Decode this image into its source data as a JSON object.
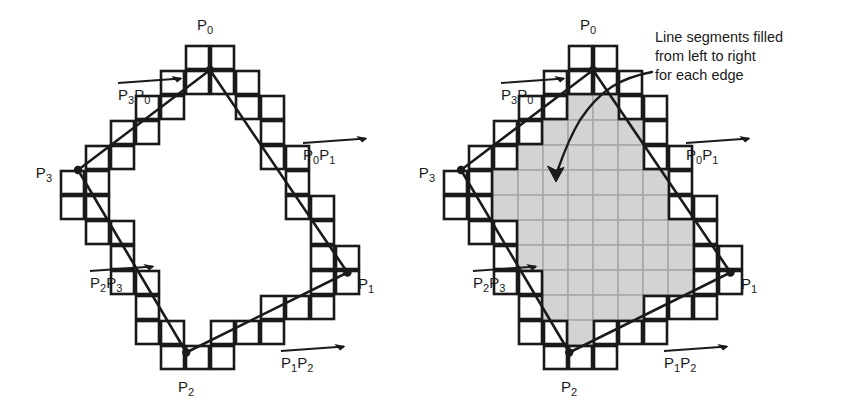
{
  "figure": {
    "background": "#ffffff",
    "ink": "#1a1a1a",
    "fill_gray": "#d3d3d3",
    "grid_gray": "#a8a8a8",
    "cell": 25,
    "panels": [
      {
        "id": "left",
        "name": "outline-only",
        "origin": [
          60,
          45
        ],
        "filled": false,
        "vertices": [
          {
            "key": "P0",
            "label": "P",
            "sub": "0",
            "grid": [
              6.0,
              1.0
            ],
            "label_pos": [
              205,
              30
            ],
            "anchor": "middle"
          },
          {
            "key": "P1",
            "label": "P",
            "sub": "1",
            "grid": [
              11.5,
              9.1
            ],
            "label_pos": [
              358,
              289
            ],
            "anchor": "start"
          },
          {
            "key": "P2",
            "label": "P",
            "sub": "2",
            "grid": [
              5.05,
              12.3
            ],
            "grid_dot": [
              5.05,
              12.3
            ],
            "label_pos": [
              186,
              392
            ],
            "anchor": "middle"
          },
          {
            "key": "P3",
            "label": "P",
            "sub": "3",
            "grid": [
              0.72,
              5.0
            ],
            "label_pos": [
              52,
              178
            ],
            "anchor": "end"
          }
        ],
        "edge_labels": [
          {
            "key": "P3P0",
            "a": "P",
            "asub": "3",
            "b": "P",
            "bsub": "0",
            "x": 118,
            "y": 100,
            "bar_w": 72
          },
          {
            "key": "P0P1",
            "a": "P",
            "asub": "0",
            "b": "P",
            "bsub": "1",
            "x": 303,
            "y": 160,
            "bar_w": 72
          },
          {
            "key": "P2P3",
            "a": "P",
            "asub": "2",
            "b": "P",
            "bsub": "3",
            "x": 90,
            "y": 288,
            "bar_w": 72
          },
          {
            "key": "P1P2",
            "a": "P",
            "asub": "1",
            "b": "P",
            "bsub": "2",
            "x": 281,
            "y": 368,
            "bar_w": 72
          }
        ],
        "annotation": null
      },
      {
        "id": "right",
        "name": "filled",
        "origin": [
          443,
          45
        ],
        "filled": true,
        "vertices": [
          {
            "key": "P0",
            "label": "P",
            "sub": "0",
            "grid": [
              6.0,
              1.0
            ],
            "label_pos": [
              588,
              30
            ],
            "anchor": "middle"
          },
          {
            "key": "P1",
            "label": "P",
            "sub": "1",
            "grid": [
              11.5,
              9.1
            ],
            "label_pos": [
              741,
              289
            ],
            "anchor": "start"
          },
          {
            "key": "P2",
            "label": "P",
            "sub": "2",
            "grid": [
              5.05,
              12.3
            ],
            "label_pos": [
              569,
              392
            ],
            "anchor": "middle"
          },
          {
            "key": "P3",
            "label": "P",
            "sub": "3",
            "grid": [
              0.72,
              5.0
            ],
            "label_pos": [
              435,
              178
            ],
            "anchor": "end"
          }
        ],
        "edge_labels": [
          {
            "key": "P3P0",
            "a": "P",
            "asub": "3",
            "b": "P",
            "bsub": "0",
            "x": 501,
            "y": 100,
            "bar_w": 72
          },
          {
            "key": "P0P1",
            "a": "P",
            "asub": "0",
            "b": "P",
            "bsub": "1",
            "x": 686,
            "y": 160,
            "bar_w": 72
          },
          {
            "key": "P2P3",
            "a": "P",
            "asub": "2",
            "b": "P",
            "bsub": "3",
            "x": 473,
            "y": 288,
            "bar_w": 72
          },
          {
            "key": "P1P2",
            "a": "P",
            "asub": "1",
            "b": "P",
            "bsub": "2",
            "x": 664,
            "y": 368,
            "bar_w": 72
          }
        ],
        "annotation": {
          "lines": [
            "Line segments filled",
            "from left to right",
            "for each edge"
          ],
          "x": 655,
          "y": 42,
          "line_height": 19,
          "leader": "M 652 72 C 620 78 600 90 580 120 C 568 140 562 158 557 172",
          "arrow_tip": [
            556,
            182
          ]
        }
      }
    ],
    "boundary_cells": [
      [
        5,
        0
      ],
      [
        6,
        0
      ],
      [
        4,
        1
      ],
      [
        5,
        1
      ],
      [
        6,
        1
      ],
      [
        7,
        1
      ],
      [
        3,
        2
      ],
      [
        4,
        2
      ],
      [
        7,
        2
      ],
      [
        8,
        2
      ],
      [
        2,
        3
      ],
      [
        3,
        3
      ],
      [
        8,
        3
      ],
      [
        1,
        4
      ],
      [
        2,
        4
      ],
      [
        8,
        4
      ],
      [
        9,
        4
      ],
      [
        0,
        5
      ],
      [
        1,
        5
      ],
      [
        9,
        5
      ],
      [
        0,
        6
      ],
      [
        1,
        6
      ],
      [
        9,
        6
      ],
      [
        10,
        6
      ],
      [
        1,
        7
      ],
      [
        2,
        7
      ],
      [
        10,
        7
      ],
      [
        2,
        8
      ],
      [
        10,
        8
      ],
      [
        11,
        8
      ],
      [
        2,
        9
      ],
      [
        3,
        9
      ],
      [
        10,
        9
      ],
      [
        11,
        9
      ],
      [
        3,
        10
      ],
      [
        8,
        10
      ],
      [
        9,
        10
      ],
      [
        10,
        10
      ],
      [
        3,
        11
      ],
      [
        4,
        11
      ],
      [
        6,
        11
      ],
      [
        7,
        11
      ],
      [
        8,
        11
      ],
      [
        4,
        12
      ],
      [
        5,
        12
      ],
      [
        6,
        12
      ]
    ],
    "interior_cells": [
      [
        5,
        2
      ],
      [
        6,
        2
      ],
      [
        4,
        3
      ],
      [
        5,
        3
      ],
      [
        6,
        3
      ],
      [
        7,
        3
      ],
      [
        3,
        4
      ],
      [
        4,
        4
      ],
      [
        5,
        4
      ],
      [
        6,
        4
      ],
      [
        7,
        4
      ],
      [
        2,
        5
      ],
      [
        3,
        5
      ],
      [
        4,
        5
      ],
      [
        5,
        5
      ],
      [
        6,
        5
      ],
      [
        7,
        5
      ],
      [
        8,
        5
      ],
      [
        2,
        6
      ],
      [
        3,
        6
      ],
      [
        4,
        6
      ],
      [
        5,
        6
      ],
      [
        6,
        6
      ],
      [
        7,
        6
      ],
      [
        8,
        6
      ],
      [
        3,
        7
      ],
      [
        4,
        7
      ],
      [
        5,
        7
      ],
      [
        6,
        7
      ],
      [
        7,
        7
      ],
      [
        8,
        7
      ],
      [
        9,
        7
      ],
      [
        3,
        8
      ],
      [
        4,
        8
      ],
      [
        5,
        8
      ],
      [
        6,
        8
      ],
      [
        7,
        8
      ],
      [
        8,
        8
      ],
      [
        9,
        8
      ],
      [
        4,
        9
      ],
      [
        5,
        9
      ],
      [
        6,
        9
      ],
      [
        7,
        9
      ],
      [
        8,
        9
      ],
      [
        9,
        9
      ],
      [
        4,
        10
      ],
      [
        5,
        10
      ],
      [
        6,
        10
      ],
      [
        7,
        10
      ],
      [
        5,
        11
      ]
    ]
  }
}
